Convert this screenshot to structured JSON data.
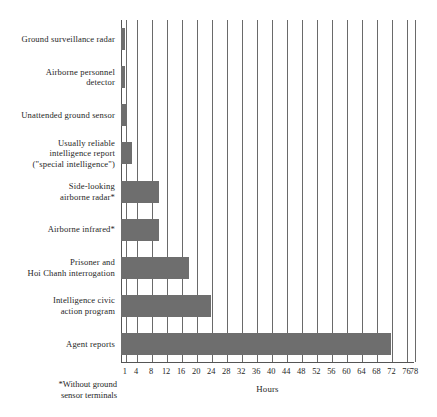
{
  "chart_data": {
    "type": "bar",
    "orientation": "horizontal",
    "title": "",
    "subtitle": "",
    "xlabel": "Hours",
    "ylabel": "",
    "xlim": [
      0,
      78
    ],
    "grid": true,
    "legend_position": "none",
    "xticks": [
      1,
      4,
      8,
      12,
      16,
      20,
      24,
      28,
      32,
      36,
      40,
      44,
      48,
      52,
      56,
      60,
      64,
      68,
      72,
      76,
      78
    ],
    "xtick_labels": [
      "1",
      "4",
      "8",
      "12",
      "16",
      "20",
      "24",
      "28",
      "32",
      "36",
      "40",
      "44",
      "48",
      "52",
      "56",
      "60",
      "64",
      "68",
      "72",
      "76",
      "78"
    ],
    "bar_color": "#6e6e6e",
    "categories": [
      "Ground surveillance radar",
      "Airborne personnel detector",
      "Unattended ground sensor",
      "Usually reliable intelligence report (\"special intelligence\")",
      "Side-looking airborne radar*",
      "Airborne infrared*",
      "Prisoner and Hoi Chanh interrogation",
      "Intelligence civic action program",
      "Agent reports"
    ],
    "values": [
      1,
      1,
      1.5,
      3,
      10,
      10,
      18,
      24,
      72
    ],
    "annotations": [
      "*Without ground sensor terminals"
    ]
  },
  "axis": {
    "x_title": "Hours",
    "tick_labels": [
      "1",
      "4",
      "8",
      "12",
      "16",
      "20",
      "24",
      "28",
      "32",
      "36",
      "40",
      "44",
      "48",
      "52",
      "56",
      "60",
      "64",
      "68",
      "72",
      "76",
      "78"
    ]
  },
  "rows": [
    {
      "label_lines": [
        "Ground surveillance radar"
      ],
      "value": 1
    },
    {
      "label_lines": [
        "Airborne personnel",
        "detector"
      ],
      "value": 1
    },
    {
      "label_lines": [
        "Unattended ground sensor"
      ],
      "value": 1.5
    },
    {
      "label_lines": [
        "Usually reliable",
        "intelligence report",
        "(\"special intelligence\")"
      ],
      "value": 3
    },
    {
      "label_lines": [
        "Side-looking",
        "airborne radar*"
      ],
      "value": 10
    },
    {
      "label_lines": [
        "Airborne infrared*"
      ],
      "value": 10
    },
    {
      "label_lines": [
        "Prisoner and",
        "Hoi Chanh interrogation"
      ],
      "value": 18
    },
    {
      "label_lines": [
        "Intelligence civic",
        "action program"
      ],
      "value": 24
    },
    {
      "label_lines": [
        "Agent reports"
      ],
      "value": 72
    }
  ],
  "footnote": {
    "line1": "*Without ground",
    "line2": "sensor terminals"
  }
}
